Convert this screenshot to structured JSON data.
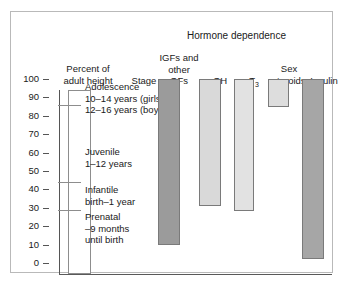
{
  "figure": {
    "hormone_dependence_title": "Hormone dependence",
    "percent_axis_label": "Percent of\nadult height",
    "stage_column_label": "Stage"
  },
  "columns": [
    {
      "id": "igfs",
      "label": "IGFs and\nother\nGFs"
    },
    {
      "id": "gh",
      "label": "GH"
    },
    {
      "id": "t3",
      "label": "T3",
      "label_base": "T",
      "label_sub": "3"
    },
    {
      "id": "sex-steroids",
      "label": "Sex\nsteroids"
    },
    {
      "id": "insulin",
      "label": "Insulin"
    }
  ],
  "axis": {
    "ticks": [
      0,
      10,
      20,
      30,
      40,
      50,
      60,
      70,
      80,
      90,
      100
    ],
    "min": 0,
    "max": 100,
    "unit": "percent of adult height"
  },
  "stages": [
    {
      "name": "Adolescence",
      "detail": "Adolescence\n10–14 years (girls)\n12–16 years (boys)",
      "range_percent": [
        86,
        100
      ]
    },
    {
      "name": "Juvenile",
      "detail": "Juvenile\n1–12 years",
      "range_percent": [
        44,
        86
      ]
    },
    {
      "name": "Infantile",
      "detail": "Infantile\nbirth–1 year",
      "range_percent": [
        29,
        44
      ]
    },
    {
      "name": "Prenatal",
      "detail": "Prenatal\n–9 months\nuntil birth",
      "range_percent": [
        0,
        29
      ]
    }
  ],
  "chart_data": {
    "type": "bar",
    "title": "Hormone dependence",
    "xlabel": "",
    "ylabel": "Percent of adult height",
    "ylim": [
      0,
      100
    ],
    "grid": false,
    "legend": "none",
    "orientation": "vertical-range-bars",
    "categories": [
      "IGFs and other GFs",
      "GH",
      "T3",
      "Sex steroids",
      "Insulin"
    ],
    "bars": [
      {
        "category": "IGFs and other GFs",
        "from": 10,
        "to": 100,
        "color": "#9b9b9b"
      },
      {
        "category": "GH",
        "from": 31,
        "to": 100,
        "color": "#d9d9d9"
      },
      {
        "category": "T3",
        "from": 28,
        "to": 100,
        "color": "#e2e2e2"
      },
      {
        "category": "Sex steroids",
        "from": 85,
        "to": 100,
        "color": "#dddddd"
      },
      {
        "category": "Insulin",
        "from": 2,
        "to": 100,
        "color": "#a6a6a6"
      }
    ],
    "stage_segments": [
      {
        "stage": "Adolescence",
        "from": 86,
        "to": 100
      },
      {
        "stage": "Juvenile",
        "from": 44,
        "to": 86
      },
      {
        "stage": "Infantile",
        "from": 29,
        "to": 44
      },
      {
        "stage": "Prenatal",
        "from": 0,
        "to": 29
      }
    ]
  },
  "colors": {
    "frame": "#b9b9b9",
    "axis": "#555555",
    "text": "#1a1a1a",
    "bar_dark": "#9b9b9b",
    "bar_light": "#dddddd"
  }
}
